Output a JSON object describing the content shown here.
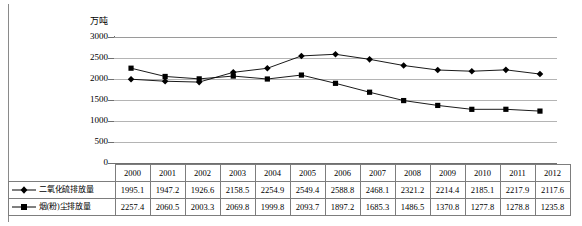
{
  "chart_data": {
    "type": "line",
    "title": "",
    "subtitle": "",
    "xlabel": "",
    "ylabel": "万吨",
    "unit_label": "万吨",
    "ylim": [
      0,
      3000
    ],
    "ytick_step": 500,
    "yticks": [
      "3000",
      "2500",
      "2000",
      "1500",
      "1000",
      "500",
      "0"
    ],
    "grid": true,
    "legend_position": "table-row-labels",
    "categories": [
      "2000",
      "2001",
      "2002",
      "2003",
      "2004",
      "2005",
      "2006",
      "2007",
      "2008",
      "2009",
      "2010",
      "2011",
      "2012"
    ],
    "series": [
      {
        "name": "二氧化硫排放量",
        "marker": "diamond",
        "color": "#000000",
        "values": [
          1995.1,
          1947.2,
          1926.6,
          2158.5,
          2254.9,
          2549.4,
          2588.8,
          2468.1,
          2321.2,
          2214.4,
          2185.1,
          2217.9,
          2117.6
        ]
      },
      {
        "name": "烟(粉)尘排放量",
        "marker": "square",
        "color": "#000000",
        "values": [
          2257.4,
          2060.5,
          2003.3,
          2069.8,
          1999.8,
          2093.7,
          1897.2,
          1685.3,
          1486.5,
          1370.8,
          1277.8,
          1278.8,
          1235.8
        ]
      }
    ]
  },
  "table": {
    "header_corner": "",
    "years": [
      "2000",
      "2001",
      "2002",
      "2003",
      "2004",
      "2005",
      "2006",
      "2007",
      "2008",
      "2009",
      "2010",
      "2011",
      "2012"
    ],
    "rows": [
      {
        "label": "二氧化硫排放量",
        "marker": "diamond",
        "values": [
          "1995.1",
          "1947.2",
          "1926.6",
          "2158.5",
          "2254.9",
          "2549.4",
          "2588.8",
          "2468.1",
          "2321.2",
          "2214.4",
          "2185.1",
          "2217.9",
          "2117.6"
        ]
      },
      {
        "label": "烟(粉)尘排放量",
        "marker": "square",
        "values": [
          "2257.4",
          "2060.5",
          "2003.3",
          "2069.8",
          "1999.8",
          "2093.7",
          "1897.2",
          "1685.3",
          "1486.5",
          "1370.8",
          "1277.8",
          "1278.8",
          "1235.8"
        ]
      }
    ]
  },
  "colors": {
    "series_line": "#000000",
    "gridline": "#b4b4b4",
    "axis": "#6f6f6f",
    "table_border": "#7d7d7d",
    "background": "#ffffff"
  }
}
